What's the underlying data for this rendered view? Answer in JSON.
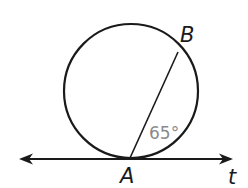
{
  "diagram": {
    "type": "geometry-tangent-chord",
    "circle": {
      "cx": 131,
      "cy": 91,
      "r": 67
    },
    "points": [
      {
        "id": "A",
        "label": "A",
        "x": 130,
        "y": 158
      },
      {
        "id": "B",
        "label": "B",
        "x": 179,
        "y": 52
      }
    ],
    "tangent_line": {
      "label": "t",
      "x1": 20,
      "x2": 232,
      "y": 159
    },
    "chord": {
      "from": "A",
      "to": "B"
    },
    "angle": {
      "label": "65°",
      "between": [
        "chord AB",
        "tangent t"
      ]
    },
    "colors": {
      "stroke": "#1a1a1a",
      "angle_label": "#8a8a8a",
      "background": "#ffffff"
    }
  }
}
